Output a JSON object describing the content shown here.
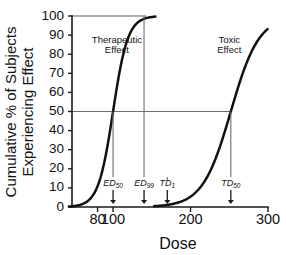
{
  "chart_data": {
    "type": "line",
    "title": "",
    "xlabel": "Dose",
    "ylabel_line1": "Cumulative % of Subjects",
    "ylabel_line2": "Experiencing Effect",
    "xlim": [
      47,
      300
    ],
    "ylim": [
      0,
      100
    ],
    "grid": false,
    "legend_position": "inline-annotations",
    "xticks": [
      80,
      100,
      200,
      300
    ],
    "xtick_labels": [
      "80",
      "100",
      "200",
      "300"
    ],
    "yticks": [
      0,
      10,
      20,
      30,
      40,
      50,
      60,
      70,
      80,
      90,
      100
    ],
    "ytick_labels": [
      "0",
      "10",
      "20",
      "30",
      "40",
      "50",
      "60",
      "70",
      "80",
      "90",
      "100"
    ],
    "series": [
      {
        "name": "Therapeutic Effect",
        "ed50": 100,
        "slope": 0.105,
        "ceiling": 100,
        "x": [
          55,
          60,
          65,
          70,
          75,
          80,
          85,
          90,
          95,
          100,
          105,
          110,
          115,
          120,
          125,
          130,
          135,
          140,
          145,
          150,
          155
        ],
        "values": [
          0.9,
          1.5,
          2.5,
          4.2,
          7.0,
          11.3,
          17.7,
          26.4,
          37.5,
          50.0,
          62.5,
          73.6,
          82.3,
          88.7,
          93.0,
          95.8,
          97.5,
          98.5,
          99.1,
          99.5,
          99.7
        ]
      },
      {
        "name": "Toxic Effect",
        "td50": 252,
        "slope": 0.055,
        "ceiling": 100,
        "x": [
          165,
          175,
          185,
          195,
          205,
          215,
          225,
          235,
          245,
          255,
          265,
          275,
          285,
          295,
          300
        ],
        "values": [
          0.9,
          1.5,
          2.6,
          4.4,
          7.4,
          12.1,
          19.2,
          29.0,
          41.2,
          54.4,
          66.9,
          77.4,
          85.3,
          90.8,
          92.8
        ]
      }
    ],
    "reference_lines": [
      {
        "name": "hundred-percent-line",
        "orientation": "horizontal",
        "value": 100,
        "x_from": 47,
        "x_to": 143
      },
      {
        "name": "fifty-percent-line",
        "orientation": "horizontal",
        "value": 50,
        "x_from": 47,
        "x_to": 252
      }
    ],
    "annotations": [
      {
        "name": "therapeutic-effect-label",
        "line1": "Therapeutic",
        "line2": "Effect",
        "x": 105,
        "y": 86
      },
      {
        "name": "toxic-effect-label",
        "line1": "Toxic",
        "line2": "Effect",
        "x": 250,
        "y": 86
      }
    ],
    "markers": [
      {
        "name": "ed50-marker",
        "symbol": "ED",
        "subscript": "50",
        "dose": 100,
        "from_percent": 50,
        "label_percent": 11
      },
      {
        "name": "ed99-marker",
        "symbol": "ED",
        "subscript": "99",
        "dose": 140,
        "from_percent": 100,
        "label_percent": 11
      },
      {
        "name": "td1-marker",
        "symbol": "TD",
        "subscript": "1",
        "dose": 170,
        "from_percent": 14,
        "label_percent": 11
      },
      {
        "name": "td50-marker",
        "symbol": "TD",
        "subscript": "50",
        "dose": 252,
        "from_percent": 50,
        "label_percent": 11
      }
    ]
  }
}
